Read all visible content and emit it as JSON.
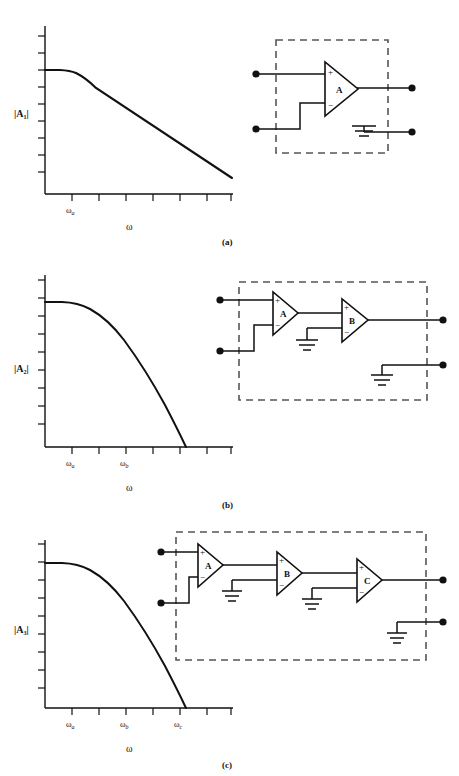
{
  "figure": {
    "background_color": "#ffffff",
    "line_color": "#111111",
    "dash_color": "#555555"
  },
  "panels": [
    {
      "id": "a",
      "caption": "(a)",
      "chart": {
        "type": "line",
        "title": "",
        "xlabel": "ω",
        "ylabel": "|A₁|",
        "ylabel_parts": {
          "bar_left": "|",
          "a": "A",
          "sub": "1",
          "bar_right": "|"
        },
        "grid": false,
        "legend": "none",
        "xlim": [
          0,
          7
        ],
        "ylim": [
          0,
          10
        ],
        "x_ticks": [
          1,
          2,
          3,
          4,
          5,
          6,
          7
        ],
        "x_tick_labels": [
          "ωa",
          "",
          "",
          "",
          "",
          "",
          ""
        ],
        "x_tick_label_main": "ω",
        "x_tick_label_subs": [
          "a"
        ],
        "y_ticks": [
          1,
          2,
          3,
          4,
          5,
          6,
          7,
          8,
          9
        ],
        "series": [
          {
            "name": "|A1|",
            "x": [
              0.0,
              0.3,
              0.6,
              0.85,
              1.0,
              1.15,
              1.35,
              1.6,
              2.0,
              2.6,
              3.4,
              4.4,
              5.4,
              6.4,
              7.0
            ],
            "y": [
              7.6,
              7.6,
              7.58,
              7.5,
              7.35,
              7.1,
              6.75,
              6.35,
              5.75,
              4.95,
              4.0,
              3.0,
              2.1,
              1.25,
              0.8
            ]
          }
        ]
      },
      "circuit": {
        "dashed_box": true,
        "stages": [
          {
            "label": "A",
            "plus": "+",
            "minus": "−"
          }
        ],
        "input_terminals": 2,
        "output_terminals": 2,
        "ground_symbols": 1
      }
    },
    {
      "id": "b",
      "caption": "(b)",
      "chart": {
        "type": "line",
        "title": "",
        "xlabel": "ω",
        "ylabel": "|A₂|",
        "ylabel_parts": {
          "bar_left": "|",
          "a": "A",
          "sub": "2",
          "bar_right": "|"
        },
        "grid": false,
        "legend": "none",
        "xlim": [
          0,
          7
        ],
        "ylim": [
          0,
          10
        ],
        "x_ticks": [
          1,
          2,
          3,
          4,
          5,
          6,
          7
        ],
        "x_tick_labels": [
          "ωa",
          "",
          "ωb",
          "",
          "",
          "",
          ""
        ],
        "x_tick_label_main": "ω",
        "x_tick_label_subs": [
          "a",
          "b"
        ],
        "y_ticks": [
          1,
          2,
          3,
          4,
          5,
          6,
          7,
          8,
          9
        ],
        "series": [
          {
            "name": "|A2|",
            "x": [
              0.0,
              0.4,
              0.8,
              1.1,
              1.5,
              2.0,
              2.5,
              3.0,
              3.5,
              4.0,
              4.4,
              4.8,
              5.1,
              5.35,
              5.5
            ],
            "y": [
              7.8,
              7.78,
              7.65,
              7.45,
              7.05,
              6.4,
              5.6,
              4.7,
              3.7,
              2.65,
              1.8,
              1.0,
              0.5,
              0.15,
              0.0
            ]
          }
        ]
      },
      "circuit": {
        "dashed_box": true,
        "stages": [
          {
            "label": "A",
            "plus": "+",
            "minus": "−"
          },
          {
            "label": "B",
            "plus": "+",
            "minus": "−"
          }
        ],
        "input_terminals": 2,
        "output_terminals": 2,
        "ground_symbols": 2
      }
    },
    {
      "id": "c",
      "caption": "(c)",
      "chart": {
        "type": "line",
        "title": "",
        "xlabel": "ω",
        "ylabel": "|A₃|",
        "ylabel_parts": {
          "bar_left": "|",
          "a": "A",
          "sub": "3",
          "bar_right": "|"
        },
        "grid": false,
        "legend": "none",
        "xlim": [
          0,
          7
        ],
        "ylim": [
          0,
          10
        ],
        "x_ticks": [
          1,
          2,
          3,
          4,
          5,
          6,
          7
        ],
        "x_tick_labels": [
          "ωa",
          "",
          "ωb",
          "",
          "ωc",
          "",
          ""
        ],
        "x_tick_label_main": "ω",
        "x_tick_label_subs": [
          "a",
          "b",
          "c"
        ],
        "y_ticks": [
          1,
          2,
          3,
          4,
          5,
          6,
          7,
          8,
          9
        ],
        "series": [
          {
            "name": "|A3|",
            "x": [
              0.0,
              0.4,
              0.8,
              1.1,
              1.5,
              2.0,
              2.5,
              3.0,
              3.5,
              4.0,
              4.4,
              4.8,
              5.1,
              5.35,
              5.5
            ],
            "y": [
              7.9,
              7.88,
              7.75,
              7.55,
              7.15,
              6.5,
              5.7,
              4.75,
              3.75,
              2.7,
              1.85,
              1.05,
              0.5,
              0.15,
              0.0
            ]
          }
        ]
      },
      "circuit": {
        "dashed_box": true,
        "stages": [
          {
            "label": "A",
            "plus": "+",
            "minus": "−"
          },
          {
            "label": "B",
            "plus": "+",
            "minus": "−"
          },
          {
            "label": "C",
            "plus": "+",
            "minus": "−"
          }
        ],
        "input_terminals": 2,
        "output_terminals": 2,
        "ground_symbols": 3
      }
    }
  ]
}
